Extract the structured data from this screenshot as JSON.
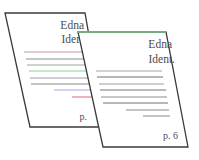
{
  "illustration": {
    "description": "Two overlapping slanted document pages",
    "back_page": {
      "title_line1": "Edna",
      "title_line2": "Ident.",
      "page_label": "p.",
      "border_color": "#3a3a3a",
      "lines": [
        {
          "color": "#c89aa0"
        },
        {
          "color": "#8a8f99"
        },
        {
          "color": "#9aa89a"
        },
        {
          "color": "#7fd88a"
        },
        {
          "color": "#9a9aa8"
        },
        {
          "color": "#8a8a8a"
        },
        {
          "color": "#a9a6e6"
        },
        {
          "color": "#d86a78"
        }
      ]
    },
    "front_page": {
      "title_line1": "Edna",
      "title_line2": "Ident.",
      "page_label": "p. 6",
      "border_color": "#3a3a3a",
      "top_edge_color": "#7cc38a",
      "lines": [
        {
          "color": "#a8a0b0"
        },
        {
          "color": "#6e7075"
        },
        {
          "color": "#9aa0a0"
        },
        {
          "color": "#707a70"
        },
        {
          "color": "#8c8c94"
        },
        {
          "color": "#707074"
        },
        {
          "color": "#8a8a8e"
        },
        {
          "color": "#8a8a8e"
        }
      ]
    }
  }
}
